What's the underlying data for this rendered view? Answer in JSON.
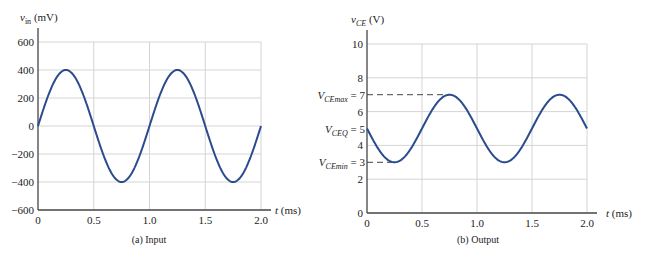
{
  "chart_data": [
    {
      "type": "line",
      "title": "",
      "caption": "(a) Input",
      "ylabel": "v_in (mV)",
      "ylabel_main": "v",
      "ylabel_sub": "in",
      "ylabel_unit": " (mV)",
      "xlabel": "t (ms)",
      "xlabel_main": "t",
      "xlabel_unit": " (ms)",
      "xlim": [
        0,
        2.0
      ],
      "ylim": [
        -600,
        600
      ],
      "xticks": [
        "0",
        "0.5",
        "1.0",
        "1.5",
        "2.0"
      ],
      "yticks": [
        "600",
        "400",
        "200",
        "0",
        "−200",
        "−400",
        "−600"
      ],
      "ytick_values": [
        600,
        400,
        200,
        0,
        -200,
        -400,
        -600
      ],
      "grid": true,
      "series": [
        {
          "name": "v_in",
          "function": "400*sin(2*pi*t/1.0)",
          "amplitude": 400,
          "offset": 0,
          "period_ms": 1.0,
          "x": [
            0,
            0.25,
            0.5,
            0.75,
            1.0,
            1.25,
            1.5,
            1.75,
            2.0
          ],
          "y": [
            0,
            400,
            0,
            -400,
            0,
            400,
            0,
            -400,
            0
          ]
        }
      ]
    },
    {
      "type": "line",
      "title": "",
      "caption": "(b) Output",
      "ylabel": "v_CE (V)",
      "ylabel_main": "v",
      "ylabel_sub": "CE",
      "ylabel_unit": " (V)",
      "xlabel": "t (ms)",
      "xlabel_main": "t",
      "xlabel_unit": " (ms)",
      "xlim": [
        0,
        2.0
      ],
      "ylim": [
        0,
        10
      ],
      "xticks": [
        "0",
        "0.5",
        "1.0",
        "1.5",
        "2.0"
      ],
      "yticks": [
        "10",
        "8",
        "6",
        "4",
        "2",
        "0"
      ],
      "ytick_values": [
        10,
        8,
        6,
        4,
        2,
        0
      ],
      "grid": true,
      "annotations": [
        {
          "label_main": "V",
          "label_sub": "CEmax",
          "label_eq": " = 7",
          "value": 7
        },
        {
          "label_main": "V",
          "label_sub": "CEQ",
          "label_eq": " = 5",
          "value": 5
        },
        {
          "label_main": "V",
          "label_sub": "CEmin",
          "label_eq": " = 3",
          "value": 3
        }
      ],
      "series": [
        {
          "name": "v_CE",
          "function": "5 - 2*sin(2*pi*t/1.0)",
          "amplitude": 2,
          "offset": 5,
          "period_ms": 1.0,
          "x": [
            0,
            0.25,
            0.5,
            0.75,
            1.0,
            1.25,
            1.5,
            1.75,
            2.0
          ],
          "y": [
            5,
            3,
            5,
            7,
            5,
            3,
            5,
            7,
            5
          ]
        }
      ]
    }
  ]
}
